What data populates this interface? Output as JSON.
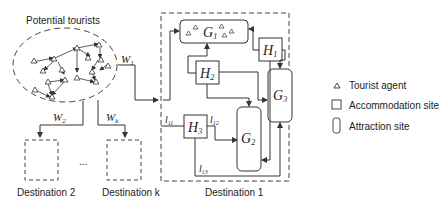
{
  "diagram": {
    "potential_tourists_label": "Potential tourists",
    "flows": {
      "w1": "W",
      "w1_sub": "1",
      "w2": "W",
      "w2_sub": "2",
      "wk": "W",
      "wk_sub": "k"
    },
    "destinations": {
      "d1": "Destination 1",
      "d2": "Destination 2",
      "dk": "Destination k",
      "ellipsis": "..."
    },
    "nodes": {
      "g1": "G",
      "g1_sub": "1",
      "g2": "G",
      "g2_sub": "2",
      "g3": "G",
      "g3_sub": "3",
      "h1": "H",
      "h1_sub": "1",
      "h2": "H",
      "h2_sub": "2",
      "h3": "H",
      "h3_sub": "3"
    },
    "edge_labels": {
      "l11": "l",
      "l11_sub": "11",
      "l12": "l",
      "l12_sub": "12",
      "l13": "l",
      "l13_sub": "13"
    },
    "legend": [
      {
        "icon": "triangle-icon",
        "label": "Tourist agent"
      },
      {
        "icon": "square-icon",
        "label": "Accommodation site"
      },
      {
        "icon": "rounded-rect-icon",
        "label": "Attraction site"
      }
    ]
  }
}
